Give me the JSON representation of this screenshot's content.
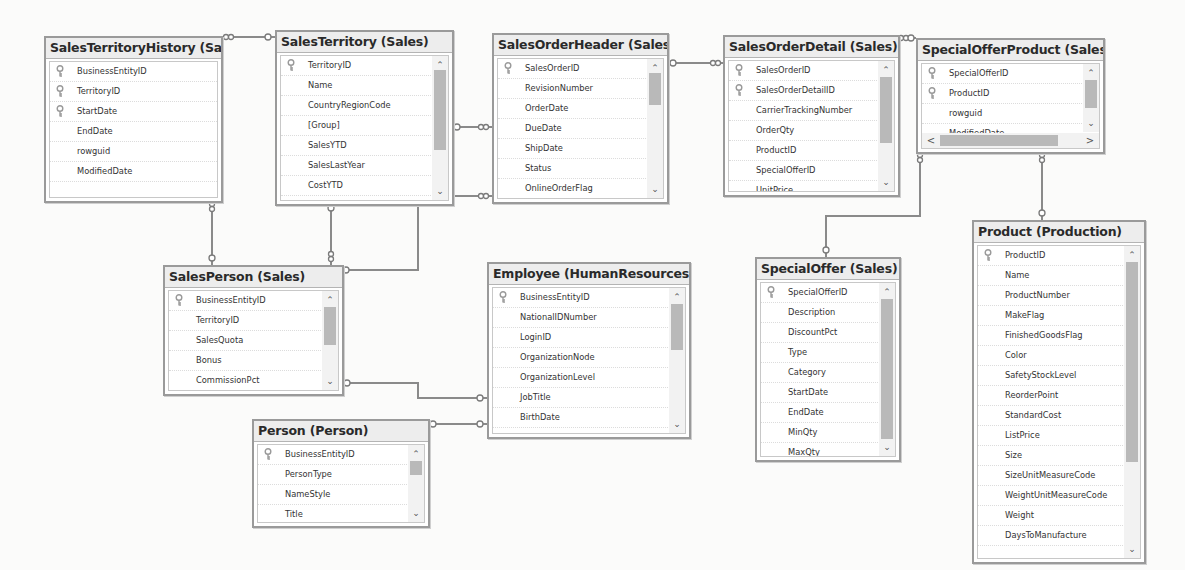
{
  "diagram": {
    "type": "database-diagram",
    "tables": [
      {
        "id": "salesterritoryhistory",
        "title": "SalesTerritoryHistory (Sales)",
        "columns": [
          {
            "name": "BusinessEntityID",
            "pk": true
          },
          {
            "name": "TerritoryID",
            "pk": true
          },
          {
            "name": "StartDate",
            "pk": true
          },
          {
            "name": "EndDate",
            "pk": false
          },
          {
            "name": "rowguid",
            "pk": false
          },
          {
            "name": "ModifiedDate",
            "pk": false
          }
        ]
      },
      {
        "id": "salesterritory",
        "title": "SalesTerritory (Sales)",
        "columns": [
          {
            "name": "TerritoryID",
            "pk": true
          },
          {
            "name": "Name",
            "pk": false
          },
          {
            "name": "CountryRegionCode",
            "pk": false
          },
          {
            "name": "[Group]",
            "pk": false
          },
          {
            "name": "SalesYTD",
            "pk": false
          },
          {
            "name": "SalesLastYear",
            "pk": false
          },
          {
            "name": "CostYTD",
            "pk": false
          },
          {
            "name": "CostLastYear",
            "pk": false
          }
        ]
      },
      {
        "id": "salesorderheader",
        "title": "SalesOrderHeader (Sales)",
        "columns": [
          {
            "name": "SalesOrderID",
            "pk": true
          },
          {
            "name": "RevisionNumber",
            "pk": false
          },
          {
            "name": "OrderDate",
            "pk": false
          },
          {
            "name": "DueDate",
            "pk": false
          },
          {
            "name": "ShipDate",
            "pk": false
          },
          {
            "name": "Status",
            "pk": false
          },
          {
            "name": "OnlineOrderFlag",
            "pk": false
          },
          {
            "name": "SalesOrderNumber",
            "pk": false
          }
        ]
      },
      {
        "id": "salesorderdetail",
        "title": "SalesOrderDetail (Sales)",
        "columns": [
          {
            "name": "SalesOrderID",
            "pk": true
          },
          {
            "name": "SalesOrderDetailID",
            "pk": true
          },
          {
            "name": "CarrierTrackingNumber",
            "pk": false
          },
          {
            "name": "OrderQty",
            "pk": false
          },
          {
            "name": "ProductID",
            "pk": false
          },
          {
            "name": "SpecialOfferID",
            "pk": false
          },
          {
            "name": "UnitPrice",
            "pk": false
          }
        ]
      },
      {
        "id": "specialofferproduct",
        "title": "SpecialOfferProduct (Sales)",
        "columns": [
          {
            "name": "SpecialOfferID",
            "pk": true
          },
          {
            "name": "ProductID",
            "pk": true
          },
          {
            "name": "rowguid",
            "pk": false
          },
          {
            "name": "ModifiedDate",
            "pk": false
          }
        ]
      },
      {
        "id": "salesperson",
        "title": "SalesPerson (Sales)",
        "columns": [
          {
            "name": "BusinessEntityID",
            "pk": true
          },
          {
            "name": "TerritoryID",
            "pk": false
          },
          {
            "name": "SalesQuota",
            "pk": false
          },
          {
            "name": "Bonus",
            "pk": false
          },
          {
            "name": "CommissionPct",
            "pk": false
          },
          {
            "name": "SalesYTD",
            "pk": false
          }
        ]
      },
      {
        "id": "employee",
        "title": "Employee (HumanResources)",
        "columns": [
          {
            "name": "BusinessEntityID",
            "pk": true
          },
          {
            "name": "NationalIDNumber",
            "pk": false
          },
          {
            "name": "LoginID",
            "pk": false
          },
          {
            "name": "OrganizationNode",
            "pk": false
          },
          {
            "name": "OrganizationLevel",
            "pk": false
          },
          {
            "name": "JobTitle",
            "pk": false
          },
          {
            "name": "BirthDate",
            "pk": false
          },
          {
            "name": "MaritalStatus",
            "pk": false
          }
        ]
      },
      {
        "id": "person",
        "title": "Person (Person)",
        "columns": [
          {
            "name": "BusinessEntityID",
            "pk": true
          },
          {
            "name": "PersonType",
            "pk": false
          },
          {
            "name": "NameStyle",
            "pk": false
          },
          {
            "name": "Title",
            "pk": false
          },
          {
            "name": "FirstName",
            "pk": false
          }
        ]
      },
      {
        "id": "specialoffer",
        "title": "SpecialOffer (Sales)",
        "columns": [
          {
            "name": "SpecialOfferID",
            "pk": true
          },
          {
            "name": "Description",
            "pk": false
          },
          {
            "name": "DiscountPct",
            "pk": false
          },
          {
            "name": "Type",
            "pk": false
          },
          {
            "name": "Category",
            "pk": false
          },
          {
            "name": "StartDate",
            "pk": false
          },
          {
            "name": "EndDate",
            "pk": false
          },
          {
            "name": "MinQty",
            "pk": false
          },
          {
            "name": "MaxQty",
            "pk": false
          },
          {
            "name": "rowguid",
            "pk": false
          },
          {
            "name": "ModifiedDate",
            "pk": false
          }
        ]
      },
      {
        "id": "product",
        "title": "Product (Production)",
        "columns": [
          {
            "name": "ProductID",
            "pk": true
          },
          {
            "name": "Name",
            "pk": false
          },
          {
            "name": "ProductNumber",
            "pk": false
          },
          {
            "name": "MakeFlag",
            "pk": false
          },
          {
            "name": "FinishedGoodsFlag",
            "pk": false
          },
          {
            "name": "Color",
            "pk": false
          },
          {
            "name": "SafetyStockLevel",
            "pk": false
          },
          {
            "name": "ReorderPoint",
            "pk": false
          },
          {
            "name": "StandardCost",
            "pk": false
          },
          {
            "name": "ListPrice",
            "pk": false
          },
          {
            "name": "Size",
            "pk": false
          },
          {
            "name": "SizeUnitMeasureCode",
            "pk": false
          },
          {
            "name": "WeightUnitMeasureCode",
            "pk": false
          },
          {
            "name": "Weight",
            "pk": false
          },
          {
            "name": "DaysToManufacture",
            "pk": false
          }
        ]
      }
    ],
    "relationships": [
      {
        "from": "salesterritoryhistory",
        "to": "salesterritory"
      },
      {
        "from": "salesorderheader",
        "to": "salesterritory"
      },
      {
        "from": "salesorderdetail",
        "to": "salesorderheader"
      },
      {
        "from": "salesorderdetail",
        "to": "specialofferproduct"
      },
      {
        "from": "specialofferproduct",
        "to": "specialoffer"
      },
      {
        "from": "specialofferproduct",
        "to": "product"
      },
      {
        "from": "salesterritoryhistory",
        "to": "salesperson"
      },
      {
        "from": "salesperson",
        "to": "salesterritory"
      },
      {
        "from": "salesorderheader",
        "to": "salesperson"
      },
      {
        "from": "salesperson",
        "to": "employee"
      },
      {
        "from": "employee",
        "to": "person"
      }
    ],
    "scroll_glyphs": {
      "up": "⌃",
      "down": "⌄",
      "left": "<",
      "right": ">"
    },
    "colors": {
      "border": "#9a9a9a",
      "title_bg": "#ededed",
      "line": "#8a8a8a",
      "scroll_thumb": "#b9b9b9",
      "key_icon": "#9a9a9a"
    }
  }
}
